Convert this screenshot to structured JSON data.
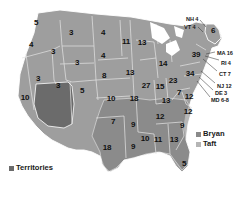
{
  "figure": {
    "name": "us-electoral-vote-map",
    "colors": {
      "bryan": "#7d7d7d",
      "taft": "#9e9e9e",
      "territories": "#6b6b6b",
      "background": "#ffffff",
      "border": "#d9d9d9",
      "text": "#111111"
    }
  },
  "legend_candidates": {
    "items": [
      {
        "label": "Bryan",
        "color": "#8a8a8a"
      },
      {
        "label": "Taft",
        "color": "#b5b5b5"
      }
    ]
  },
  "legend_territories": {
    "items": [
      {
        "label": "Territories",
        "color": "#6b6b6b"
      }
    ]
  },
  "chart_data": {
    "type": "map",
    "title": "",
    "states": [
      {
        "code": "WA",
        "value": "5",
        "x": 36,
        "y": 23
      },
      {
        "code": "OR",
        "value": "4",
        "x": 31,
        "y": 45
      },
      {
        "code": "ID",
        "value": "3",
        "x": 53,
        "y": 52
      },
      {
        "code": "MT",
        "value": "3",
        "x": 71,
        "y": 33
      },
      {
        "code": "ND",
        "value": "4",
        "x": 103,
        "y": 33
      },
      {
        "code": "SD",
        "value": "4",
        "x": 103,
        "y": 56
      },
      {
        "code": "WY",
        "value": "3",
        "x": 77,
        "y": 63
      },
      {
        "code": "NV",
        "value": "3",
        "x": 38,
        "y": 79
      },
      {
        "code": "UT",
        "value": "3",
        "x": 58,
        "y": 86
      },
      {
        "code": "CO",
        "value": "5",
        "x": 82,
        "y": 91
      },
      {
        "code": "CA",
        "value": "10",
        "x": 25,
        "y": 98
      },
      {
        "code": "NE",
        "value": "8",
        "x": 104,
        "y": 76
      },
      {
        "code": "KS",
        "value": "10",
        "x": 111,
        "y": 99
      },
      {
        "code": "OK",
        "value": "7",
        "x": 113,
        "y": 122
      },
      {
        "code": "TX",
        "value": "18",
        "x": 107,
        "y": 148
      },
      {
        "code": "MN",
        "value": "11",
        "x": 126,
        "y": 42
      },
      {
        "code": "IA",
        "value": "13",
        "x": 130,
        "y": 73
      },
      {
        "code": "MO",
        "value": "18",
        "x": 134,
        "y": 99
      },
      {
        "code": "AR",
        "value": "9",
        "x": 133,
        "y": 125
      },
      {
        "code": "LA",
        "value": "9",
        "x": 133,
        "y": 147
      },
      {
        "code": "WI",
        "value": "13",
        "x": 142,
        "y": 43
      },
      {
        "code": "IL",
        "value": "27",
        "x": 146,
        "y": 86
      },
      {
        "code": "IN",
        "value": "15",
        "x": 160,
        "y": 87
      },
      {
        "code": "MI",
        "value": "14",
        "x": 163,
        "y": 64
      },
      {
        "code": "OH",
        "value": "23",
        "x": 173,
        "y": 81
      },
      {
        "code": "KY",
        "value": "13",
        "x": 166,
        "y": 101
      },
      {
        "code": "TN",
        "value": "12",
        "x": 160,
        "y": 117
      },
      {
        "code": "MS",
        "value": "10",
        "x": 145,
        "y": 139
      },
      {
        "code": "AL",
        "value": "11",
        "x": 158,
        "y": 140
      },
      {
        "code": "GA",
        "value": "13",
        "x": 174,
        "y": 140
      },
      {
        "code": "FL",
        "value": "5",
        "x": 184,
        "y": 164
      },
      {
        "code": "SC",
        "value": "9",
        "x": 182,
        "y": 126
      },
      {
        "code": "NC",
        "value": "12",
        "x": 188,
        "y": 112
      },
      {
        "code": "VA",
        "value": "12",
        "x": 189,
        "y": 97
      },
      {
        "code": "WV",
        "value": "7",
        "x": 179,
        "y": 93
      },
      {
        "code": "PA",
        "value": "34",
        "x": 190,
        "y": 74
      },
      {
        "code": "NY",
        "value": "39",
        "x": 196,
        "y": 55
      },
      {
        "code": "ME",
        "value": "6",
        "x": 213,
        "y": 31
      }
    ],
    "callouts": [
      {
        "label": "NH 4",
        "x": 186,
        "y": 17,
        "anchor_x": 206,
        "anchor_y": 26
      },
      {
        "label": "VT 4",
        "x": 184,
        "y": 25,
        "anchor_x": 202,
        "anchor_y": 31
      },
      {
        "label": "MA 16",
        "x": 217,
        "y": 51,
        "anchor_x": 208,
        "anchor_y": 53
      },
      {
        "label": "RI 4",
        "x": 221,
        "y": 61,
        "anchor_x": 207,
        "anchor_y": 57
      },
      {
        "label": "CT 7",
        "x": 219,
        "y": 72,
        "anchor_x": 205,
        "anchor_y": 60
      },
      {
        "label": "NJ 12",
        "x": 217,
        "y": 84,
        "anchor_x": 202,
        "anchor_y": 72
      },
      {
        "label": "DE 3",
        "x": 215,
        "y": 91,
        "anchor_x": 200,
        "anchor_y": 78
      },
      {
        "label": "MD 6-8",
        "x": 211,
        "y": 98,
        "anchor_x": 198,
        "anchor_y": 82
      }
    ]
  }
}
